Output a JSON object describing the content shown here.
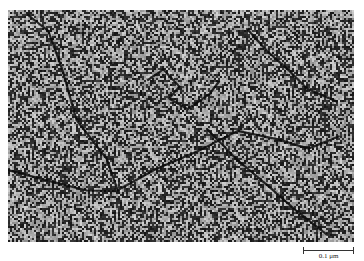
{
  "figure": {
    "type": "electron-micrograph",
    "colors": {
      "background": "#8a8a8a",
      "dark_grain": "#1a1a1a",
      "light_grain": "#b8b8b8"
    }
  },
  "scale_bar": {
    "label": "0.1 μm"
  }
}
